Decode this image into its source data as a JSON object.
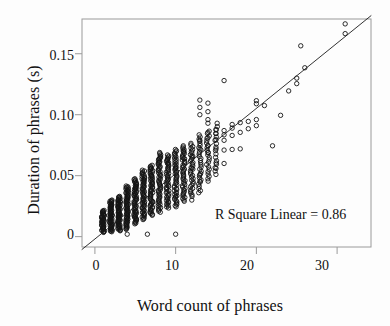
{
  "chart_data": {
    "type": "scatter",
    "title": "",
    "xlabel": "Word count of phrases",
    "ylabel": "Duration of phrases (s)",
    "xlim": [
      -1.6,
      34.2
    ],
    "ylim": [
      -0.0085,
      0.1785
    ],
    "xticks": [
      0,
      10,
      20,
      30
    ],
    "xticklabels": [
      "0",
      "10",
      "20",
      "30"
    ],
    "yticks": [
      0,
      0.05,
      0.1,
      0.15
    ],
    "yticklabels": [
      "0",
      "0.05",
      "0.10",
      "0.15"
    ],
    "grid": false,
    "legend": null,
    "annotations": [
      {
        "text": "R Square Linear = 0.86",
        "x": 21.5,
        "y": 0.0245
      }
    ],
    "marker": {
      "shape": "open-circle",
      "size_px": 4.4,
      "edge_color": "#141414",
      "face_color": "none",
      "edge_width": 0.9
    },
    "fit_line": {
      "kind": "linear-regression",
      "r_squared": 0.86,
      "slope": 0.005355,
      "intercept": -0.00193,
      "color": "#1b1b1b",
      "width": 0.9,
      "x_start": -1.6,
      "x_end": 34.2
    },
    "frame": {
      "color": "#9a9a9a",
      "width": 1
    },
    "series": [
      {
        "name": "phrases",
        "note": "Dense vertical columns of open circles at integer word counts 1-15; sparse individual points 16-31.",
        "columns": [
          {
            "x": 1,
            "y_min": 0.0035,
            "y_max": 0.0215,
            "n": 46
          },
          {
            "x": 2,
            "y_min": 0.004,
            "y_max": 0.03,
            "n": 60
          },
          {
            "x": 3,
            "y_min": 0.0048,
            "y_max": 0.033,
            "n": 62
          },
          {
            "x": 4,
            "y_min": 0.006,
            "y_max": 0.0415,
            "n": 64
          },
          {
            "x": 5,
            "y_min": 0.0105,
            "y_max": 0.0475,
            "n": 60
          },
          {
            "x": 6,
            "y_min": 0.014,
            "y_max": 0.0545,
            "n": 58
          },
          {
            "x": 7,
            "y_min": 0.0175,
            "y_max": 0.0585,
            "n": 56
          },
          {
            "x": 8,
            "y_min": 0.02,
            "y_max": 0.069,
            "n": 54
          },
          {
            "x": 9,
            "y_min": 0.0235,
            "y_max": 0.067,
            "n": 50
          },
          {
            "x": 10,
            "y_min": 0.0245,
            "y_max": 0.0715,
            "n": 48
          },
          {
            "x": 11,
            "y_min": 0.029,
            "y_max": 0.0745,
            "n": 44
          },
          {
            "x": 12,
            "y_min": 0.033,
            "y_max": 0.0765,
            "n": 34
          },
          {
            "x": 13,
            "y_min": 0.036,
            "y_max": 0.0835,
            "n": 28
          },
          {
            "x": 14,
            "y_min": 0.0455,
            "y_max": 0.0865,
            "n": 22
          },
          {
            "x": 15,
            "y_min": 0.051,
            "y_max": 0.093,
            "n": 16
          }
        ],
        "points": [
          [
            4,
            0.002
          ],
          [
            6.5,
            0.002
          ],
          [
            10,
            0.002
          ],
          [
            5,
            0.04
          ],
          [
            6,
            0.047
          ],
          [
            7,
            0.05
          ],
          [
            7,
            0.056
          ],
          [
            8,
            0.061
          ],
          [
            8,
            0.064
          ],
          [
            9,
            0.06
          ],
          [
            9,
            0.063
          ],
          [
            10,
            0.033
          ],
          [
            10,
            0.056
          ],
          [
            11,
            0.064
          ],
          [
            11,
            0.07
          ],
          [
            12,
            0.03
          ],
          [
            12,
            0.056
          ],
          [
            12,
            0.066
          ],
          [
            13,
            0.0455
          ],
          [
            13,
            0.051
          ],
          [
            13,
            0.072
          ],
          [
            13,
            0.079
          ],
          [
            13,
            0.1
          ],
          [
            13,
            0.106
          ],
          [
            13,
            0.112
          ],
          [
            14,
            0.069
          ],
          [
            14,
            0.0745
          ],
          [
            14,
            0.081
          ],
          [
            14,
            0.0855
          ],
          [
            14,
            0.093
          ],
          [
            14,
            0.096
          ],
          [
            14,
            0.1025
          ],
          [
            14,
            0.1095
          ],
          [
            15,
            0.056
          ],
          [
            15,
            0.0605
          ],
          [
            15,
            0.072
          ],
          [
            15,
            0.0795
          ],
          [
            15,
            0.0845
          ],
          [
            15,
            0.088
          ],
          [
            16,
            0.06
          ],
          [
            16,
            0.071
          ],
          [
            16,
            0.079
          ],
          [
            16,
            0.0835
          ],
          [
            16,
            0.087
          ],
          [
            16,
            0.128
          ],
          [
            17,
            0.0715
          ],
          [
            17,
            0.083
          ],
          [
            17,
            0.089
          ],
          [
            17,
            0.092
          ],
          [
            18,
            0.072
          ],
          [
            18,
            0.0855
          ],
          [
            18,
            0.0935
          ],
          [
            19,
            0.0885
          ],
          [
            19,
            0.0945
          ],
          [
            20,
            0.091
          ],
          [
            20,
            0.096
          ],
          [
            20,
            0.109
          ],
          [
            20,
            0.1115
          ],
          [
            21,
            0.1075
          ],
          [
            22,
            0.0745
          ],
          [
            23,
            0.0995
          ],
          [
            24,
            0.1195
          ],
          [
            25,
            0.1255
          ],
          [
            25,
            0.13
          ],
          [
            26,
            0.1385
          ],
          [
            25.5,
            0.1565
          ],
          [
            31,
            0.1665
          ],
          [
            31,
            0.1745
          ]
        ]
      }
    ]
  },
  "axis": {
    "y_title": "Duration of phrases (s)",
    "x_title": "Word count of phrases",
    "y_tick_0": "0",
    "y_tick_1": "0.05",
    "y_tick_2": "0.10",
    "y_tick_3": "0.15",
    "x_tick_0": "0",
    "x_tick_1": "10",
    "x_tick_2": "20",
    "x_tick_3": "30"
  },
  "annotation": {
    "r_square_text": "R Square Linear = 0.86"
  }
}
